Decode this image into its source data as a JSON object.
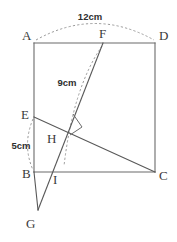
{
  "figure": {
    "type": "geometry-diagram",
    "stroke_color": "#6b6b6b",
    "dash_color": "#9a9a9a",
    "label_color": "#3a3a3a",
    "background": "#ffffff",
    "vertices": [
      {
        "id": "A",
        "label": "A",
        "x": 34,
        "y": 43,
        "label_x": 22,
        "label_y": 40
      },
      {
        "id": "D",
        "label": "D",
        "x": 155,
        "y": 43,
        "label_x": 159,
        "label_y": 40
      },
      {
        "id": "B",
        "label": "B",
        "x": 34,
        "y": 172,
        "label_x": 22,
        "label_y": 178
      },
      {
        "id": "C",
        "label": "C",
        "x": 155,
        "y": 172,
        "label_x": 159,
        "label_y": 180
      },
      {
        "id": "E",
        "label": "E",
        "x": 34,
        "y": 117,
        "label_x": 21,
        "label_y": 119
      },
      {
        "id": "F",
        "label": "F",
        "x": 103,
        "y": 43,
        "label_x": 99,
        "label_y": 38
      },
      {
        "id": "G",
        "label": "G",
        "x": 38,
        "y": 210,
        "label_x": 26,
        "label_y": 228
      },
      {
        "id": "H",
        "label": "H",
        "x": 68,
        "y": 127,
        "label_x": 47,
        "label_y": 143
      },
      {
        "id": "I",
        "label": "I",
        "x": 52,
        "y": 172,
        "label_x": 53,
        "label_y": 184
      }
    ],
    "dimensions": [
      {
        "id": "top-arc",
        "label": "12cm",
        "label_x": 90,
        "label_y": 20,
        "measures": "A to D"
      },
      {
        "id": "fold-arc",
        "label": "9cm",
        "label_x": 67,
        "label_y": 86,
        "measures": "F to H region"
      },
      {
        "id": "left-arc",
        "label": "5cm",
        "label_x": 21,
        "label_y": 149,
        "measures": "E to B"
      }
    ],
    "segments": [
      {
        "id": "AD",
        "from": "A",
        "to": "D",
        "style": "solid"
      },
      {
        "id": "AB",
        "from": "A",
        "to": "B",
        "style": "solid"
      },
      {
        "id": "DC",
        "from": "D",
        "to": "C",
        "style": "solid"
      },
      {
        "id": "BC",
        "from": "B",
        "to": "C",
        "style": "solid"
      },
      {
        "id": "EC",
        "from": "E",
        "to": "C",
        "style": "solid"
      },
      {
        "id": "FG",
        "from": "F",
        "to": "G",
        "style": "solid"
      },
      {
        "id": "BG",
        "from": "B",
        "to": "G",
        "style": "solid"
      }
    ],
    "arcs": [
      {
        "id": "arc-AD",
        "from": "A",
        "to": "D",
        "style": "dashed",
        "bulge": "up"
      },
      {
        "id": "arc-FH",
        "from": "F",
        "to": "I",
        "style": "dashed",
        "bulge": "left"
      },
      {
        "id": "arc-EB",
        "from": "E",
        "to": "B",
        "style": "dashed",
        "bulge": "left"
      }
    ],
    "markers": [
      {
        "id": "right-angle-H",
        "at": "H",
        "type": "right-angle-square"
      }
    ]
  }
}
